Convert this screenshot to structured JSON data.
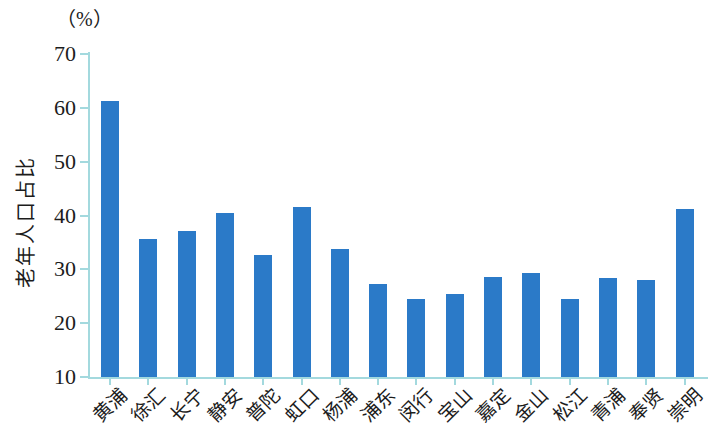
{
  "figure": {
    "unit_label": "（%）",
    "y_axis_title": "老年人口占比"
  },
  "chart_data": {
    "type": "bar",
    "title": "",
    "xlabel": "",
    "ylabel": "老年人口占比",
    "unit_label": "（%）",
    "categories": [
      "黄浦",
      "徐汇",
      "长宁",
      "静安",
      "普陀",
      "虹口",
      "杨浦",
      "浦东",
      "闵行",
      "宝山",
      "嘉定",
      "金山",
      "松江",
      "青浦",
      "奉贤",
      "崇明"
    ],
    "values": [
      61.2,
      35.7,
      37.2,
      40.4,
      32.7,
      41.5,
      33.8,
      27.2,
      24.5,
      25.5,
      28.5,
      29.3,
      24.5,
      28.3,
      28.0,
      41.3
    ],
    "ylim": [
      10,
      70
    ],
    "yticks": [
      10,
      20,
      30,
      40,
      50,
      60,
      70
    ],
    "grid": false,
    "legend": "none",
    "bar_color": "#2b7ac8",
    "axis_color": "#a3d9de",
    "text_color": "#1c1c1c"
  }
}
